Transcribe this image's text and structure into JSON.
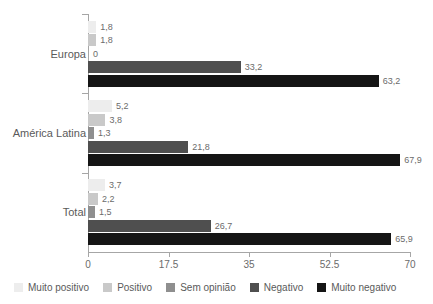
{
  "chart_data": {
    "type": "bar",
    "orientation": "horizontal",
    "title": "",
    "subtitle": "",
    "xlabel": "",
    "ylabel": "",
    "xlim": [
      0,
      70
    ],
    "xticks": [
      "0",
      "17.5",
      "35",
      "52.5",
      "70"
    ],
    "xtick_values": [
      0,
      17.5,
      35,
      52.5,
      70
    ],
    "grid": false,
    "legend_position": "bottom",
    "categories": [
      "Europa",
      "América Latina",
      "Total"
    ],
    "series": [
      {
        "name": "Muito positivo",
        "color": "#ededed",
        "values": [
          1.8,
          5.2,
          3.7
        ],
        "labels": [
          "1,8",
          "5,2",
          "3,7"
        ]
      },
      {
        "name": "Positivo",
        "color": "#c9c9c9",
        "values": [
          1.8,
          3.8,
          2.2
        ],
        "labels": [
          "1,8",
          "3,8",
          "2,2"
        ]
      },
      {
        "name": "Sem opinião",
        "color": "#8f8f8f",
        "values": [
          0.0,
          1.3,
          1.5
        ],
        "labels": [
          "0",
          "1,3",
          "1,5"
        ]
      },
      {
        "name": "Negativo",
        "color": "#4f4f4f",
        "values": [
          33.2,
          21.8,
          26.7
        ],
        "labels": [
          "33,2",
          "21,8",
          "26,7"
        ]
      },
      {
        "name": "Muito negativo",
        "color": "#151515",
        "values": [
          63.2,
          67.9,
          65.9
        ],
        "labels": [
          "63,2",
          "67,9",
          "65,9"
        ]
      }
    ]
  },
  "legend": {
    "items": [
      {
        "label": "Muito positivo",
        "color": "#ededed"
      },
      {
        "label": "Positivo",
        "color": "#c9c9c9"
      },
      {
        "label": "Sem opinião",
        "color": "#8f8f8f"
      },
      {
        "label": "Negativo",
        "color": "#4f4f4f"
      },
      {
        "label": "Muito negativo",
        "color": "#151515"
      }
    ]
  }
}
